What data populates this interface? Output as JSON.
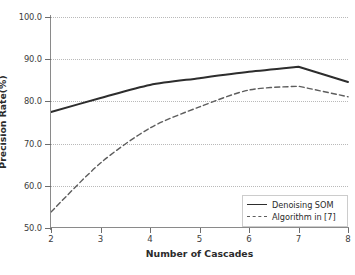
{
  "chart_data": {
    "type": "line",
    "title": "",
    "xlabel": "Number of Cascades",
    "ylabel": "Precision Rate(%)",
    "x": [
      2,
      3,
      4,
      5,
      6,
      7,
      8
    ],
    "xtick_labels": [
      "2",
      "3",
      "4",
      "5",
      "6",
      "7",
      "8"
    ],
    "ytick_labels": [
      "50.0",
      "60.0",
      "70.0",
      "80.0",
      "90.0",
      "100.0"
    ],
    "yticks": [
      50,
      60,
      70,
      80,
      90,
      100
    ],
    "xlim": [
      2,
      8
    ],
    "ylim": [
      50,
      100
    ],
    "grid": "horizontal-dotted",
    "legend_position": "lower-right",
    "series": [
      {
        "name": "Denoising SOM",
        "style": "solid",
        "color": "#2d2d2d",
        "values": [
          77.5,
          80.8,
          83.9,
          85.5,
          87.0,
          88.2,
          84.6
        ]
      },
      {
        "name": "Algorithm in [7]",
        "style": "dashed",
        "color": "#5d5d5d",
        "values": [
          53.8,
          65.4,
          73.7,
          78.7,
          82.7,
          83.6,
          81.1
        ]
      }
    ]
  },
  "legend": {
    "items": [
      {
        "label": "Denoising SOM"
      },
      {
        "label": "Algorithm in [7]"
      }
    ]
  },
  "axes": {
    "x_title": "Number of Cascades",
    "y_title": "Precision Rate(%)"
  }
}
